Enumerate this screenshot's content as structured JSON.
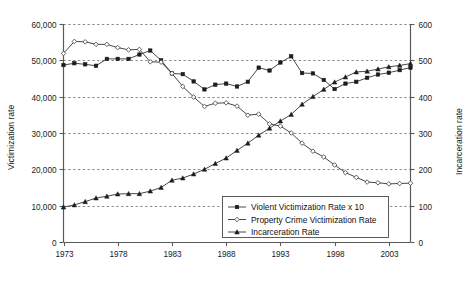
{
  "chart_data": {
    "type": "line",
    "title": "",
    "xlabel": "",
    "ylabel": "Victimization rate",
    "y2label": "Incarceration rate",
    "grid": true,
    "legend_position": "bottom-right",
    "xlim": [
      1973,
      2005
    ],
    "ylim": [
      0,
      60000
    ],
    "y2lim": [
      0,
      600
    ],
    "x": [
      1973,
      1974,
      1975,
      1976,
      1977,
      1978,
      1979,
      1980,
      1981,
      1982,
      1983,
      1984,
      1985,
      1986,
      1987,
      1988,
      1989,
      1990,
      1991,
      1992,
      1993,
      1994,
      1995,
      1996,
      1997,
      1998,
      1999,
      2000,
      2001,
      2002,
      2003,
      2004,
      2005
    ],
    "x_ticks": [
      1973,
      1978,
      1983,
      1988,
      1993,
      1998,
      2003
    ],
    "x_tick_labels": [
      "1973",
      "1978",
      "1983",
      "1988",
      "1993",
      "1998",
      "2003"
    ],
    "y_ticks": [
      0,
      10000,
      20000,
      30000,
      40000,
      50000,
      60000
    ],
    "y_tick_labels": [
      "0",
      "10,000",
      "20,000",
      "30,000",
      "40,000",
      "50,000",
      "60,000"
    ],
    "y2_ticks": [
      0,
      100,
      200,
      300,
      400,
      500,
      600
    ],
    "y2_tick_labels": [
      "0",
      "100",
      "200",
      "300",
      "400",
      "500",
      "600"
    ],
    "series": [
      {
        "name": "Violent Victimization Rate x 10",
        "axis": "left",
        "marker": "filled-square",
        "values": [
          48700,
          49200,
          48900,
          48500,
          50400,
          50400,
          50400,
          51600,
          52700,
          50000,
          46400,
          46200,
          44200,
          42000,
          43300,
          43600,
          42800,
          44100,
          48000,
          47200,
          49400,
          51100,
          46500,
          46400,
          44600,
          42100,
          43600,
          44100,
          45200,
          46100,
          46600,
          47300,
          48000
        ]
      },
      {
        "name": "Property Crime Victimization Rate",
        "axis": "left",
        "marker": "open-diamond",
        "values": [
          51900,
          55200,
          55100,
          54400,
          54400,
          53500,
          52900,
          53000,
          49600,
          49500,
          46400,
          42800,
          39900,
          37300,
          38200,
          38300,
          37400,
          34900,
          35200,
          32500,
          31900,
          30000,
          27200,
          25000,
          23400,
          21200,
          19100,
          17800,
          16500,
          16300,
          16000,
          16100,
          16200
        ]
      },
      {
        "name": "Incarceration Rate",
        "axis": "right",
        "marker": "filled-triangle",
        "values": [
          96,
          102,
          111,
          121,
          126,
          132,
          133,
          133,
          140,
          150,
          170,
          176,
          187,
          200,
          216,
          231,
          252,
          272,
          294,
          313,
          333,
          351,
          379,
          400,
          420,
          440,
          454,
          468,
          470,
          476,
          482,
          486,
          491
        ]
      }
    ]
  },
  "legend": {
    "entries": [
      {
        "label": "Violent Victimization Rate x 10"
      },
      {
        "label": "Property Crime Victimization Rate"
      },
      {
        "label": "Incarceration Rate"
      }
    ]
  },
  "axes": {
    "left_title": "Victimization rate",
    "right_title": "Incarceration rate"
  },
  "colors": {
    "line": "#333333",
    "axis": "#5a5a5a",
    "grid": "#6e6e6e",
    "text": "#111111",
    "background": "#ffffff"
  }
}
